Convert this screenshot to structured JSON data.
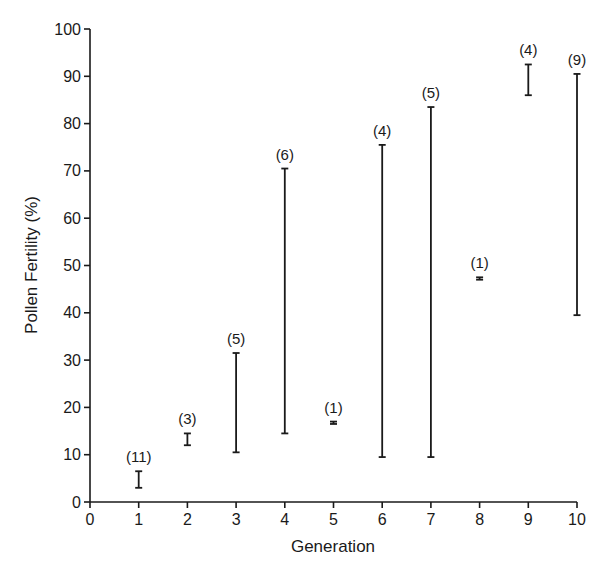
{
  "chart_data": {
    "type": "range",
    "title": "",
    "xlabel": "Generation",
    "ylabel": "Pollen Fertility (%)",
    "xlim": [
      0,
      10
    ],
    "ylim": [
      0,
      100
    ],
    "x_ticks": [
      0,
      1,
      2,
      3,
      4,
      5,
      6,
      7,
      8,
      9,
      10
    ],
    "y_ticks": [
      0,
      10,
      20,
      30,
      40,
      50,
      60,
      70,
      80,
      90,
      100
    ],
    "grid": false,
    "legend": null,
    "series": [
      {
        "name": "Pollen fertility range",
        "points": [
          {
            "x": 1,
            "min": 3,
            "max": 6.5,
            "n": "(11)"
          },
          {
            "x": 2,
            "min": 12,
            "max": 14.5,
            "n": "(3)"
          },
          {
            "x": 3,
            "min": 10.5,
            "max": 31.5,
            "n": "(5)"
          },
          {
            "x": 4,
            "min": 14.5,
            "max": 70.5,
            "n": "(6)"
          },
          {
            "x": 5,
            "min": 16.5,
            "max": 17,
            "n": "(1)"
          },
          {
            "x": 6,
            "min": 9.5,
            "max": 75.5,
            "n": "(4)"
          },
          {
            "x": 7,
            "min": 9.5,
            "max": 83.5,
            "n": "(5)"
          },
          {
            "x": 8,
            "min": 47,
            "max": 47.5,
            "n": "(1)"
          },
          {
            "x": 9,
            "min": 86,
            "max": 92.5,
            "n": "(4)"
          },
          {
            "x": 10,
            "min": 39.5,
            "max": 90.5,
            "n": "(9)"
          }
        ]
      }
    ],
    "annotations": "Numbers in parentheses give sample size (n) per generation"
  }
}
